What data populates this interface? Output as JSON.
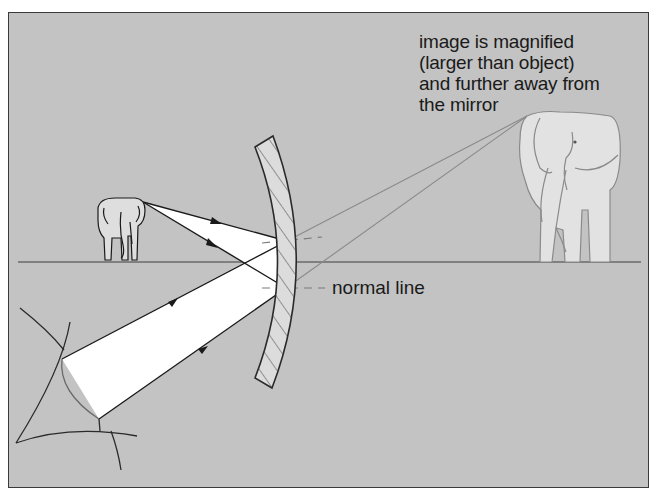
{
  "figure": {
    "caption_lines": [
      "image is magnified",
      "(larger than object)",
      "and further away from",
      "the mirror"
    ],
    "normal_label": "normal line",
    "elements": {
      "object": "small elephant (object)",
      "image": "large elephant (virtual image)",
      "mirror": "concave mirror",
      "principal_axis": "horizontal principal axis",
      "observer": "eye"
    },
    "colors": {
      "background": "#c3c3c3",
      "frame_border": "#3a3a3a",
      "ray": "#2a2a2a",
      "virtual_ray": "#8a8a8a",
      "beam_fill": "#ffffff",
      "mirror_fill": "#dcdcdc",
      "text": "#1a1a1a"
    }
  }
}
